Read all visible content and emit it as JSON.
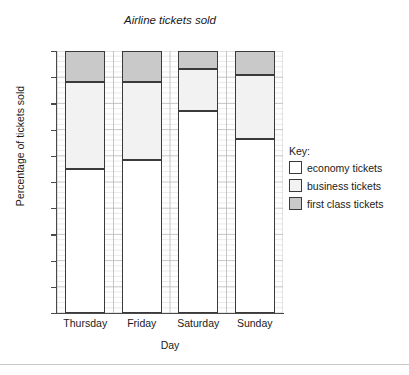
{
  "chart_data": {
    "type": "bar",
    "subtype": "stacked-percentage",
    "title": "Airline tickets sold",
    "xlabel": "Day",
    "ylabel": "Percentage of tickets sold",
    "categories": [
      "Thursday",
      "Friday",
      "Saturday",
      "Sunday"
    ],
    "ylim": [
      0,
      100
    ],
    "ytick_labels": [
      "0",
      "10",
      "20",
      "30",
      "40",
      "50",
      "60",
      "70",
      "80",
      "90",
      "100"
    ],
    "ytick_values": [
      0,
      10,
      20,
      30,
      40,
      50,
      60,
      70,
      80,
      90,
      100
    ],
    "grid": true,
    "minor_grid": true,
    "legend_position": "right",
    "legend_title": "Key:",
    "series": [
      {
        "name": "economy tickets",
        "color": "#ffffff",
        "values": [
          55,
          58.5,
          77,
          66.5
        ]
      },
      {
        "name": "business tickets",
        "color": "#f2f2f2",
        "values": [
          33,
          29.5,
          16,
          24.5
        ]
      },
      {
        "name": "first class tickets",
        "color": "#c9c9c9",
        "values": [
          12,
          12,
          7,
          9
        ]
      }
    ],
    "cumulative_boundaries": {
      "Thursday": [
        55,
        88,
        100
      ],
      "Friday": [
        58.5,
        88,
        100
      ],
      "Saturday": [
        77,
        93,
        100
      ],
      "Sunday": [
        66.5,
        91,
        100
      ]
    },
    "colors": {
      "economy": "#ffffff",
      "business": "#f2f2f2",
      "first_class": "#c9c9c9",
      "bar_outline": "#3a3a3a",
      "axis": "#4a4a4a",
      "grid_major": "#b8b8b8",
      "grid_minor": "#e2e2e2",
      "text": "#1a1a1a",
      "background": "#ffffff"
    }
  },
  "legend": {
    "title": "Key:",
    "items": [
      {
        "label": "economy tickets",
        "color": "#ffffff"
      },
      {
        "label": "business tickets",
        "color": "#f2f2f2"
      },
      {
        "label": "first class tickets",
        "color": "#c9c9c9"
      }
    ]
  }
}
